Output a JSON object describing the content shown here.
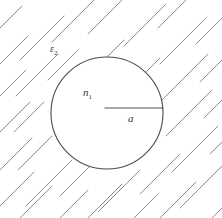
{
  "figure": {
    "background_color": "#ffffff",
    "width": 222,
    "height": 218
  },
  "colors": {
    "hatch": "#8d8d93",
    "circle_stroke": "#4a4a50",
    "radius_stroke": "#55555b",
    "label": "#3a3a40",
    "circle_fill": "#ffffff"
  },
  "labels": {
    "medium": {
      "symbol": "ε",
      "subscript": "2",
      "full": "ε₂",
      "x": 50,
      "y": 52
    },
    "index": {
      "symbol": "n",
      "subscript": "1",
      "full": "n₁",
      "x": 83,
      "y": 96
    },
    "radius": {
      "symbol": "a",
      "subscript": "",
      "full": "a",
      "x": 128,
      "y": 122
    }
  },
  "shapes": {
    "circle": {
      "name": "dielectric-sphere",
      "cx": 107,
      "cy": 113,
      "r": 56
    },
    "radius_line": {
      "name": "radius-indicator",
      "x1": 105,
      "y1": 108,
      "x2": 163,
      "y2": 108
    }
  },
  "hatching": {
    "angle_degrees": -45,
    "description": "parallel diagonal strokes running lower-left to upper-right, clipped outside the circle",
    "segments": [
      {
        "x1": -14,
        "y1": 42,
        "x2": 22,
        "y2": 6
      },
      {
        "x1": -14,
        "y1": 78,
        "x2": 28,
        "y2": 36
      },
      {
        "x1": -16,
        "y1": 112,
        "x2": 26,
        "y2": 70
      },
      {
        "x1": -16,
        "y1": 148,
        "x2": 30,
        "y2": 102
      },
      {
        "x1": -14,
        "y1": 184,
        "x2": 32,
        "y2": 138
      },
      {
        "x1": -12,
        "y1": 218,
        "x2": 34,
        "y2": 172
      },
      {
        "x1": 6,
        "y1": 232,
        "x2": 52,
        "y2": 186
      },
      {
        "x1": 20,
        "y1": 60,
        "x2": 64,
        "y2": 16
      },
      {
        "x1": 16,
        "y1": 96,
        "x2": 58,
        "y2": 54
      },
      {
        "x1": 14,
        "y1": 132,
        "x2": 44,
        "y2": 102
      },
      {
        "x1": 18,
        "y1": 170,
        "x2": 52,
        "y2": 136
      },
      {
        "x1": 26,
        "y1": 206,
        "x2": 72,
        "y2": 160
      },
      {
        "x1": 42,
        "y1": 236,
        "x2": 88,
        "y2": 190
      },
      {
        "x1": 52,
        "y1": 42,
        "x2": 98,
        "y2": -4
      },
      {
        "x1": 48,
        "y1": 80,
        "x2": 78,
        "y2": 50
      },
      {
        "x1": 60,
        "y1": 196,
        "x2": 106,
        "y2": 150
      },
      {
        "x1": 76,
        "y1": 230,
        "x2": 122,
        "y2": 184
      },
      {
        "x1": 88,
        "y1": 34,
        "x2": 130,
        "y2": -8
      },
      {
        "x1": 96,
        "y1": 68,
        "x2": 124,
        "y2": 40
      },
      {
        "x1": 98,
        "y1": 212,
        "x2": 140,
        "y2": 170
      },
      {
        "x1": 112,
        "y1": 240,
        "x2": 158,
        "y2": 194
      },
      {
        "x1": 124,
        "y1": 46,
        "x2": 166,
        "y2": 4
      },
      {
        "x1": 136,
        "y1": 82,
        "x2": 160,
        "y2": 58
      },
      {
        "x1": 140,
        "y1": 194,
        "x2": 180,
        "y2": 154
      },
      {
        "x1": 150,
        "y1": 228,
        "x2": 196,
        "y2": 182
      },
      {
        "x1": 158,
        "y1": 28,
        "x2": 202,
        "y2": -16
      },
      {
        "x1": 160,
        "y1": 64,
        "x2": 206,
        "y2": 18
      },
      {
        "x1": 162,
        "y1": 100,
        "x2": 208,
        "y2": 54
      },
      {
        "x1": 166,
        "y1": 136,
        "x2": 212,
        "y2": 90
      },
      {
        "x1": 172,
        "y1": 172,
        "x2": 218,
        "y2": 126
      },
      {
        "x1": 180,
        "y1": 208,
        "x2": 226,
        "y2": 162
      },
      {
        "x1": 190,
        "y1": 240,
        "x2": 236,
        "y2": 194
      },
      {
        "x1": 196,
        "y1": 44,
        "x2": 238,
        "y2": 2
      },
      {
        "x1": 200,
        "y1": 82,
        "x2": 240,
        "y2": 42
      },
      {
        "x1": 204,
        "y1": 118,
        "x2": 242,
        "y2": 80
      },
      {
        "x1": 210,
        "y1": 154,
        "x2": 244,
        "y2": 120
      }
    ]
  }
}
